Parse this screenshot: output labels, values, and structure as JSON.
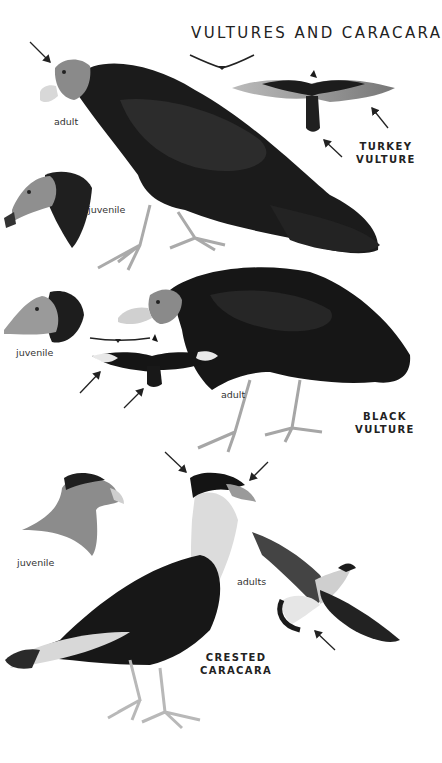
{
  "page": {
    "title": "VULTURES AND CARACARA"
  },
  "species": [
    {
      "name_line1": "TURKEY",
      "name_line2": "VULTURE",
      "labels": [
        "adult",
        "juvenile"
      ]
    },
    {
      "name_line1": "BLACK",
      "name_line2": "VULTURE",
      "labels": [
        "juvenile",
        "adult"
      ]
    },
    {
      "name_line1": "CRESTED",
      "name_line2": "CARACARA",
      "labels": [
        "juvenile",
        "adults"
      ]
    }
  ],
  "colors": {
    "background": "#ffffff",
    "plumage_dark": "#161616",
    "head_gray": "#8a8a8a",
    "text": "#222222"
  }
}
